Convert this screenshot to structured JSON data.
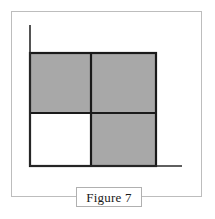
{
  "page": {
    "background_color": "#ffffff",
    "width": 215,
    "height": 219
  },
  "outer_frame": {
    "name": "figure-outer-border",
    "color": "#bdbdbd",
    "x": 11,
    "y": 11,
    "width": 191,
    "height": 186
  },
  "caption": {
    "label": "Figure 7",
    "box_border_color": "#b0b0b0",
    "box_fill_color": "#ffffff"
  },
  "chart_data": {
    "type": "diagram",
    "title": "Figure 7",
    "axes": {
      "origin": [
        30,
        166
      ],
      "vertical_axis": {
        "x": 30,
        "y_top": 25,
        "y_bottom": 166,
        "color": "#2a2a2a",
        "width": 1.6
      },
      "horizontal_axis": {
        "y": 166,
        "x_left": 30,
        "x_right": 182,
        "color": "#2a2a2a",
        "width": 1.6
      }
    },
    "square": {
      "left": 30,
      "top": 53,
      "right": 156,
      "bottom": 166,
      "outline_color": "#1a1a1a",
      "outline_width": 2.2,
      "divider_x": 91,
      "divider_y": 113
    },
    "fill_colors": {
      "shaded": "#a8a8a8",
      "unshaded": "#ffffff"
    },
    "cells": [
      {
        "id": "top-left",
        "row": 0,
        "col": 0,
        "shaded": true,
        "fill": "#a8a8a8",
        "x": 30,
        "y": 53,
        "width": 61,
        "height": 60
      },
      {
        "id": "top-right",
        "row": 0,
        "col": 1,
        "shaded": true,
        "fill": "#a8a8a8",
        "x": 91,
        "y": 53,
        "width": 65,
        "height": 60
      },
      {
        "id": "bottom-left",
        "row": 1,
        "col": 0,
        "shaded": false,
        "fill": "#ffffff",
        "x": 30,
        "y": 113,
        "width": 61,
        "height": 53
      },
      {
        "id": "bottom-right",
        "row": 1,
        "col": 1,
        "shaded": true,
        "fill": "#a8a8a8",
        "x": 91,
        "y": 113,
        "width": 65,
        "height": 53
      }
    ],
    "shaded_count": 3,
    "total_count": 4,
    "shaded_fraction": "3/4"
  }
}
